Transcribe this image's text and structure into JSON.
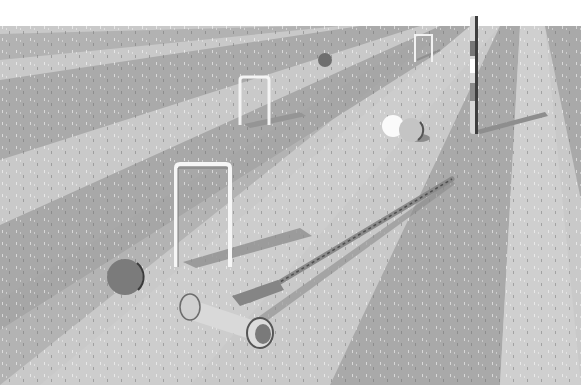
{
  "scene": {
    "description": "Grayscale illustration of a croquet lawn with radiating light and dark stripes, hoops, balls, a striped finishing peg and a mallet lying on the grass",
    "colors": {
      "sky": "#ffffff",
      "stripe_light": "#cfcfcf",
      "stripe_dark": "#a9a9a9",
      "stripe_mid": "#bcbcbc",
      "hoop": "#f2f2f2",
      "shadow": "#8e8e8e",
      "ball_dark": "#6f6f6f",
      "ball_white": "#fafafa",
      "ball_grey": "#c4c4c4",
      "peg_light": "#d8d8d8",
      "peg_dark": "#4a4a4a",
      "mallet_body": "#d9d9d9",
      "mallet_shaft": "#8a8a8a"
    },
    "horizon_y": 26,
    "objects": [
      {
        "type": "hoop",
        "label": "far-hoop",
        "x": 414,
        "y": 33,
        "w": 18,
        "h": 30
      },
      {
        "type": "hoop",
        "label": "middle-hoop",
        "x": 239,
        "y": 78,
        "w": 30,
        "h": 48
      },
      {
        "type": "hoop",
        "label": "near-hoop",
        "x": 175,
        "y": 164,
        "w": 56,
        "h": 104
      },
      {
        "type": "ball",
        "label": "far-dark-ball",
        "cx": 325,
        "cy": 60,
        "r": 7
      },
      {
        "type": "ball",
        "label": "white-ball",
        "cx": 393,
        "cy": 126,
        "r": 11
      },
      {
        "type": "ball",
        "label": "grey-ball",
        "cx": 411,
        "cy": 130,
        "r": 12
      },
      {
        "type": "ball",
        "label": "near-dark-ball",
        "cx": 125,
        "cy": 277,
        "r": 18
      },
      {
        "type": "peg",
        "label": "finishing-peg",
        "x": 470,
        "y": 16,
        "w": 7,
        "h": 118
      },
      {
        "type": "mallet",
        "label": "croquet-mallet"
      }
    ]
  }
}
